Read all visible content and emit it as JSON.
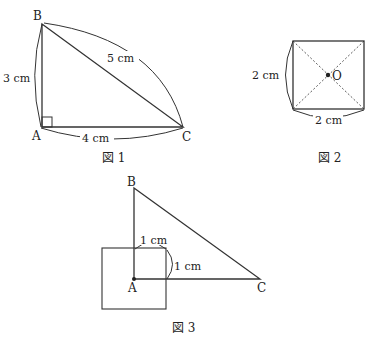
{
  "figure1": {
    "caption": "図 1",
    "vertices": {
      "A": "A",
      "B": "B",
      "C": "C"
    },
    "measures": {
      "AB": "3 cm",
      "BC": "5 cm",
      "AC": "4 cm"
    }
  },
  "figure2": {
    "caption": "図 2",
    "center": "O",
    "measures": {
      "height": "2 cm",
      "width": "2 cm"
    }
  },
  "figure3": {
    "caption": "図 3",
    "vertices": {
      "A": "A",
      "B": "B",
      "C": "C"
    },
    "measures": {
      "top": "1 cm",
      "right": "1 cm"
    }
  },
  "colors": {
    "line": "#333333",
    "background": "#ffffff"
  }
}
